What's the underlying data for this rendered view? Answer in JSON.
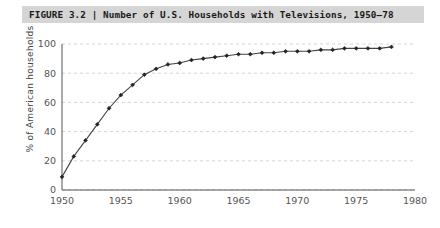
{
  "figure": {
    "label": "FIGURE 3.2",
    "separator": "|",
    "caption": "Number of U.S. Households with Televisions, 1950–78",
    "title_full": "FIGURE 3.2  |  Number of U.S. Households with Televisions, 1950–78",
    "title_bar_color": "#d5d5d5",
    "background_color": "#ffffff"
  },
  "chart_data": {
    "type": "line",
    "title": "Number of U.S. Households with Televisions, 1950–78",
    "xlabel": "",
    "ylabel": "% of American households",
    "xlim": [
      1950,
      1980
    ],
    "ylim": [
      0,
      100
    ],
    "grid": true,
    "grid_axis": "y",
    "grid_style": "dashed",
    "grid_color": "#c9c9c9",
    "legend": false,
    "line_color": "#444444",
    "marker": "diamond",
    "marker_color": "#222222",
    "xticks": [
      1950,
      1955,
      1960,
      1965,
      1970,
      1975,
      1980
    ],
    "xtick_labels": [
      "1950",
      "1955",
      "1960",
      "1965",
      "1970",
      "1975",
      "1980"
    ],
    "yticks": [
      0,
      20,
      40,
      60,
      80,
      100
    ],
    "ytick_labels": [
      "0",
      "20",
      "40",
      "60",
      "80",
      "100"
    ],
    "x": [
      1950,
      1951,
      1952,
      1953,
      1954,
      1955,
      1956,
      1957,
      1958,
      1959,
      1960,
      1961,
      1962,
      1963,
      1964,
      1965,
      1966,
      1967,
      1968,
      1969,
      1970,
      1971,
      1972,
      1973,
      1974,
      1975,
      1976,
      1977,
      1978
    ],
    "values": [
      9,
      23,
      34,
      45,
      56,
      65,
      72,
      79,
      83,
      86,
      87,
      89,
      90,
      91,
      92,
      93,
      93,
      94,
      94,
      95,
      95,
      95,
      96,
      96,
      97,
      97,
      97,
      97,
      98
    ],
    "series": [
      {
        "name": "% of American households with televisions",
        "values": [
          9,
          23,
          34,
          45,
          56,
          65,
          72,
          79,
          83,
          86,
          87,
          89,
          90,
          91,
          92,
          93,
          93,
          94,
          94,
          95,
          95,
          95,
          96,
          96,
          97,
          97,
          97,
          97,
          98
        ]
      }
    ]
  }
}
